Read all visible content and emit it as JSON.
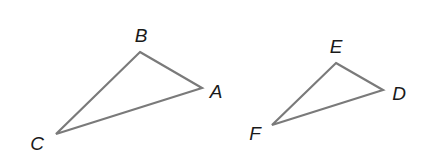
{
  "diagram": {
    "type": "geometry-triangles",
    "stroke_color": "#7a7a7a",
    "label_color": "#1a1a1a",
    "triangles": [
      {
        "name": "ABC",
        "vertices": [
          {
            "label": "B",
            "x": 140,
            "y": 52,
            "label_x": 141,
            "label_y": 42
          },
          {
            "label": "A",
            "x": 202,
            "y": 88,
            "label_x": 216,
            "label_y": 98
          },
          {
            "label": "C",
            "x": 56,
            "y": 134,
            "label_x": 37,
            "label_y": 150
          }
        ]
      },
      {
        "name": "DEF",
        "vertices": [
          {
            "label": "E",
            "x": 336,
            "y": 63,
            "label_x": 336,
            "label_y": 53
          },
          {
            "label": "D",
            "x": 383,
            "y": 90,
            "label_x": 399,
            "label_y": 100
          },
          {
            "label": "F",
            "x": 272,
            "y": 125,
            "label_x": 255,
            "label_y": 140
          }
        ]
      }
    ]
  }
}
